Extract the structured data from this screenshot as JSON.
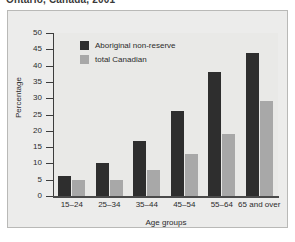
{
  "title": "Ontario, Canada, 2001",
  "chart_data": {
    "type": "bar",
    "title": "Ontario, Canada, 2001",
    "xlabel": "Age groups",
    "ylabel": "Percentage",
    "categories": [
      "15–24",
      "25–34",
      "35–44",
      "45–54",
      "55–64",
      "65 and over"
    ],
    "series": [
      {
        "name": "Aboriginal non-reserve",
        "color": "#2e2e2e",
        "values": [
          6,
          10,
          17,
          26,
          38,
          44
        ]
      },
      {
        "name": "total Canadian",
        "color": "#a8a8a8",
        "values": [
          5,
          5,
          8,
          13,
          19,
          29
        ]
      }
    ],
    "ylim": [
      0,
      50
    ],
    "yticks": [
      0,
      5,
      10,
      15,
      20,
      25,
      30,
      35,
      40,
      45,
      50
    ],
    "grid": false,
    "legend_position": "top-left-inside"
  },
  "colors": {
    "series_dark": "#2e2e2e",
    "series_light": "#a8a8a8",
    "plot_background": "#e9e9e7",
    "card_background": "#ececeb",
    "axis": "#3d3d3d",
    "text": "#2b2b2b"
  }
}
